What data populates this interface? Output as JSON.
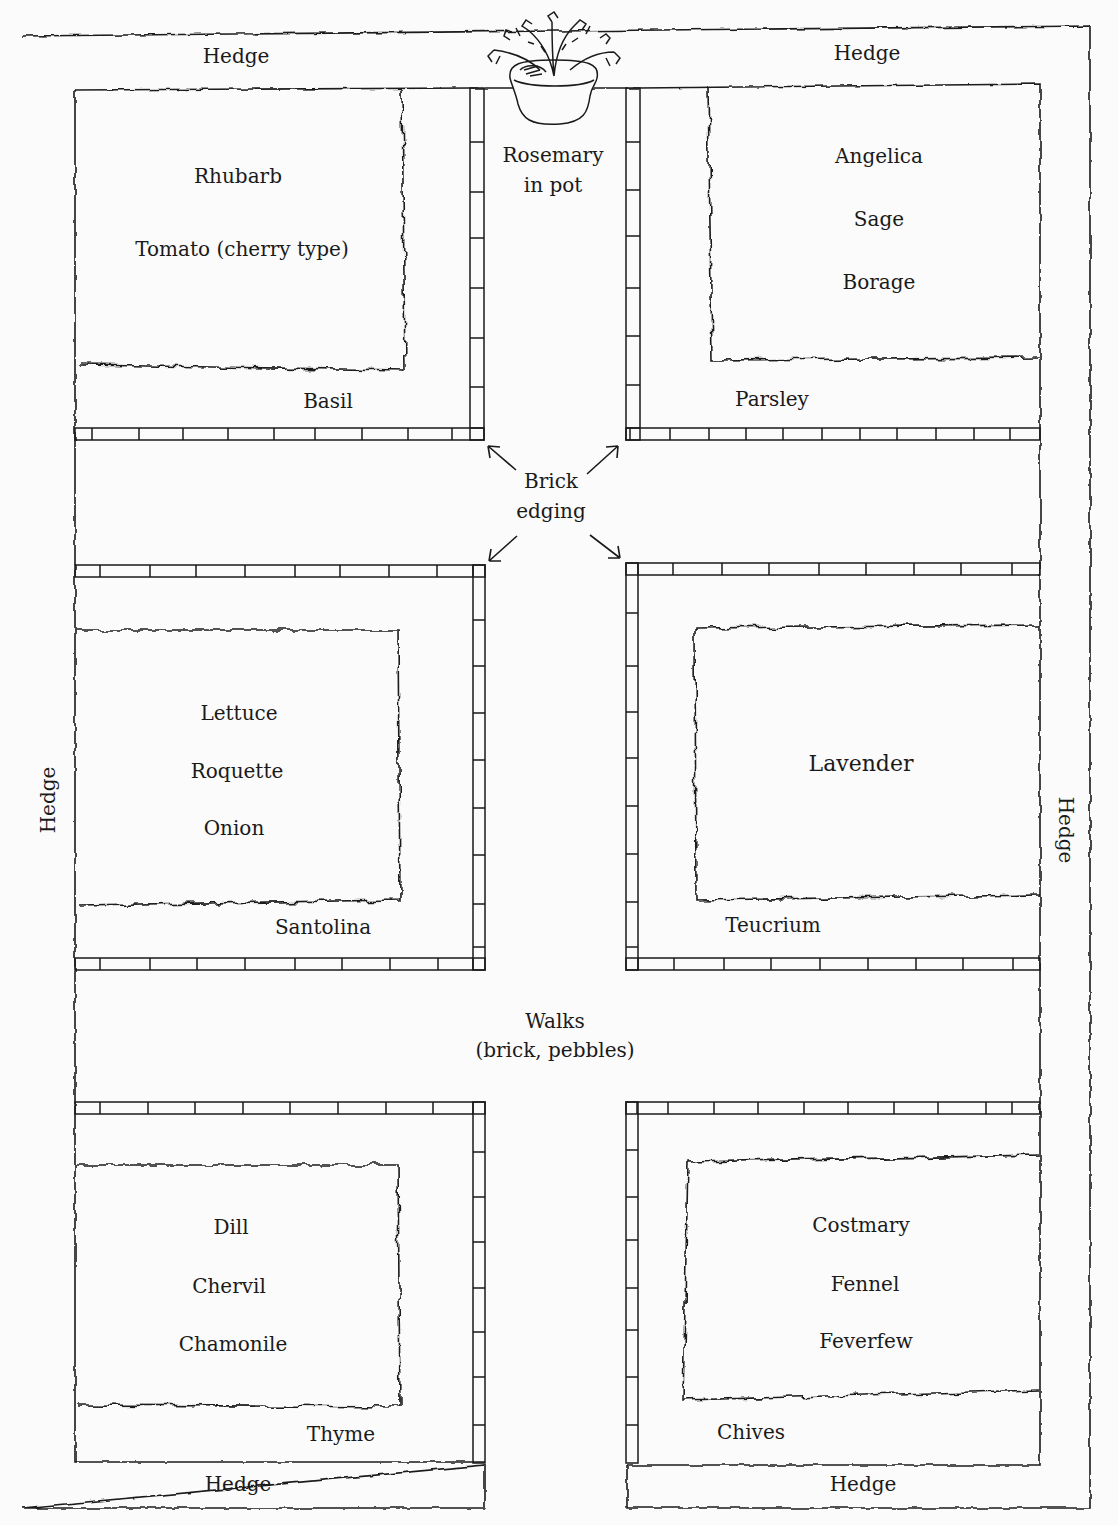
{
  "diagram": {
    "type": "herb-garden-plan",
    "hedge_labels": {
      "top_left": "Hedge",
      "top_right": "Hedge",
      "left": "Hedge",
      "right": "Hedge",
      "bottom_left": "Hedge",
      "bottom_right": "Hedge"
    },
    "center_top": {
      "label_line1": "Rosemary",
      "label_line2": "in pot",
      "icon": "potted-plant-icon"
    },
    "brick_edging": {
      "label_line1": "Brick",
      "label_line2": "edging"
    },
    "walks": {
      "label_line1": "Walks",
      "label_line2": "(brick, pebbles)"
    },
    "beds": {
      "top_left": {
        "inner": [
          "Rhubarb",
          "Tomato (cherry type)"
        ],
        "border": "Basil"
      },
      "top_right": {
        "inner": [
          "Angelica",
          "Sage",
          "Borage"
        ],
        "border": "Parsley"
      },
      "middle_left": {
        "inner": [
          "Lettuce",
          "Roquette",
          "Onion"
        ],
        "border": "Santolina"
      },
      "middle_right": {
        "inner": [
          "Lavender"
        ],
        "border": "Teucrium"
      },
      "bottom_left": {
        "inner": [
          "Dill",
          "Chervil",
          "Chamonile"
        ],
        "border": "Thyme"
      },
      "bottom_right": {
        "inner": [
          "Costmary",
          "Fennel",
          "Feverfew"
        ],
        "border": "Chives"
      }
    },
    "colors": {
      "ink": "#1a1a1a",
      "paper": "#fbfbfb"
    }
  }
}
